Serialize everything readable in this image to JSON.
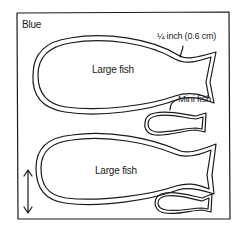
{
  "diagram": {
    "color_label": "Blue",
    "seam_allowance_label": "¼ inch (0.6 cm)",
    "pieces": [
      {
        "name": "Large fish",
        "label": "Large fish"
      },
      {
        "name": "Mini fish",
        "label": "Mini fish"
      },
      {
        "name": "Large fish",
        "label": "Large fish"
      },
      {
        "name": "Mini fish",
        "label": ""
      }
    ],
    "grain_arrow": "vertical double-headed arrow",
    "colors": {
      "line": "#1a1a1a",
      "background": "#ffffff"
    }
  }
}
